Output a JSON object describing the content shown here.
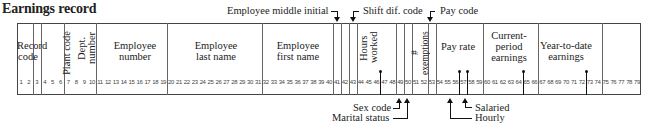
{
  "title": "Earnings record",
  "columns_total": 79,
  "fields": [
    {
      "id": "record-code",
      "label": "Record code",
      "start": 1,
      "end": 2
    },
    {
      "id": "unlabeled-3",
      "label": "",
      "start": 3,
      "end": 3
    },
    {
      "id": "plant-code",
      "label": "Plant code",
      "start": 4,
      "end": 6
    },
    {
      "id": "dept-number",
      "label": "Dept. number",
      "start": 7,
      "end": 10
    },
    {
      "id": "employee-number",
      "label": "Employee number",
      "start": 11,
      "end": 19
    },
    {
      "id": "employee-last-name",
      "label": "Employee last name",
      "start": 20,
      "end": 31
    },
    {
      "id": "employee-first-name",
      "label": "Employee first name",
      "start": 32,
      "end": 40
    },
    {
      "id": "employee-middle-initial",
      "label": "Employee middle initial",
      "start": 41,
      "end": 41
    },
    {
      "id": "unlabeled-42",
      "label": "",
      "start": 42,
      "end": 42
    },
    {
      "id": "shift-dif-code",
      "label": "Shift dif. code",
      "start": 43,
      "end": 43
    },
    {
      "id": "hours-worked",
      "label": "Hours worked",
      "start": 44,
      "end": 48
    },
    {
      "id": "sex-code",
      "label": "Sex code",
      "start": 49,
      "end": 49
    },
    {
      "id": "marital-status",
      "label": "Marital status",
      "start": 50,
      "end": 50
    },
    {
      "id": "exemptions",
      "label": "# exemptions",
      "start": 51,
      "end": 52
    },
    {
      "id": "pay-code",
      "label": "Pay code",
      "start": 53,
      "end": 53
    },
    {
      "id": "pay-rate",
      "label": "Pay rate",
      "start": 54,
      "end": 59
    },
    {
      "id": "current-period-earnings",
      "label": "Current-period earnings",
      "start": 60,
      "end": 66
    },
    {
      "id": "year-to-date-earnings",
      "label": "Year-to-date earnings",
      "start": 67,
      "end": 74
    },
    {
      "id": "unused",
      "label": "",
      "start": 75,
      "end": 79
    }
  ],
  "labels": {
    "record_code_1": "Record",
    "record_code_2": "code",
    "plant_code": "Plant code",
    "dept_1": "Dept.",
    "dept_2": "number",
    "emp_num_1": "Employee",
    "emp_num_2": "number",
    "last_1": "Employee",
    "last_2": "last name",
    "first_1": "Employee",
    "first_2": "first name",
    "hours_1": "Hours",
    "hours_2": "worked",
    "exemptions": "# exemptions",
    "pay_rate": "Pay rate",
    "cur_1": "Current-",
    "cur_2": "period",
    "cur_3": "earnings",
    "ytd_1": "Year-to-date",
    "ytd_2": "earnings"
  },
  "annotations": {
    "middle_initial": "Employee middle initial",
    "shift_dif": "Shift dif. code",
    "pay_code": "Pay code",
    "sex_code": "Sex code",
    "marital_status": "Marital status",
    "salaried": "Salaried",
    "hourly": "Hourly"
  },
  "decimal_points_after_columns": [
    46,
    56,
    57,
    64,
    72
  ]
}
